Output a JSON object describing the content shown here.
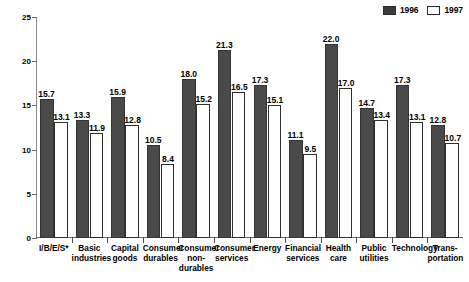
{
  "legend": {
    "position": "top-right",
    "entries": [
      {
        "label": "1996",
        "swatch": "fill-dark",
        "color": "#4a4a4a"
      },
      {
        "label": "1997",
        "swatch": "fill-light",
        "color": "#ffffff"
      }
    ]
  },
  "chart_data": {
    "type": "bar",
    "title": "",
    "subtitle": "",
    "xlabel": "",
    "ylabel": "",
    "ylim": [
      0,
      25
    ],
    "yticks": [
      0,
      5,
      10,
      15,
      20,
      25
    ],
    "grid": false,
    "legend_position": "top-right",
    "categories": [
      "I/B/E/S*",
      "Basic\nindustries",
      "Capital\ngoods",
      "Consumer\ndurables",
      "Consumer\nnon-\ndurables",
      "Consumer\nservices",
      "Energy",
      "Financial\nservices",
      "Health\ncare",
      "Public\nutilities",
      "Technology",
      "Trans-\nportation"
    ],
    "series": [
      {
        "name": "1996",
        "values": [
          15.7,
          13.3,
          15.9,
          10.5,
          18.0,
          21.3,
          17.3,
          11.1,
          22.0,
          14.7,
          17.3,
          12.8
        ]
      },
      {
        "name": "1997",
        "values": [
          13.1,
          11.9,
          12.8,
          8.4,
          15.2,
          16.5,
          15.1,
          9.5,
          17.0,
          13.4,
          13.1,
          10.7
        ]
      }
    ],
    "value_labels": {
      "1996": [
        "15.7",
        "13.3",
        "15.9",
        "10.5",
        "18.0",
        "21.3",
        "17.3",
        "11.1",
        "22.0",
        "14.7",
        "17.3",
        "12.8"
      ],
      "1997": [
        "13.1",
        "11.9",
        "12.8",
        "8.4",
        "15.2",
        "16.5",
        "15.1",
        "9.5",
        "17.0",
        "13.4",
        "13.1",
        "10.7"
      ]
    },
    "ytick_labels": [
      "0",
      "5",
      "10",
      "15",
      "20",
      "25"
    ]
  }
}
